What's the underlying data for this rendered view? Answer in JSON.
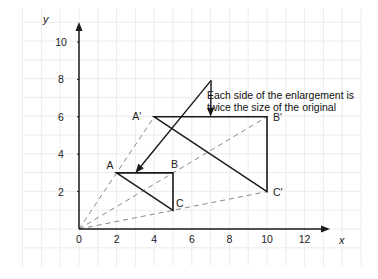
{
  "axes": {
    "x_label": "x",
    "y_label": "y",
    "x_ticks": [
      {
        "value": 0,
        "label": "0"
      },
      {
        "value": 2,
        "label": "2"
      },
      {
        "value": 4,
        "label": "4"
      },
      {
        "value": 6,
        "label": "6"
      },
      {
        "value": 8,
        "label": "8"
      },
      {
        "value": 10,
        "label": "10"
      },
      {
        "value": 12,
        "label": "12"
      }
    ],
    "y_ticks": [
      {
        "value": 2,
        "label": "2"
      },
      {
        "value": 4,
        "label": "4"
      },
      {
        "value": 6,
        "label": "6"
      },
      {
        "value": 8,
        "label": "8"
      },
      {
        "value": 10,
        "label": "10"
      }
    ],
    "x_range": [
      -3,
      14.5
    ],
    "y_range": [
      -1.9,
      11.7
    ],
    "grid": true
  },
  "centre_of_enlargement": {
    "x": 0,
    "y": 0
  },
  "scale_factor": 2,
  "original_triangle": {
    "vertices": [
      {
        "name": "A",
        "label": "A",
        "x": 2,
        "y": 3
      },
      {
        "name": "B",
        "label": "B",
        "x": 5,
        "y": 3
      },
      {
        "name": "C",
        "label": "C",
        "x": 5,
        "y": 1
      }
    ]
  },
  "enlarged_triangle": {
    "vertices": [
      {
        "name": "A-prime",
        "label": "A′",
        "x": 4,
        "y": 6
      },
      {
        "name": "B-prime",
        "label": "B′",
        "x": 10,
        "y": 6
      },
      {
        "name": "C-prime",
        "label": "C′",
        "x": 10,
        "y": 2
      }
    ]
  },
  "annotation": {
    "line1": "Each side of the enlargement is",
    "line2": "twice the size of the original",
    "pointer_origin": {
      "x": 7,
      "y": 8
    },
    "pointer_targets": [
      {
        "x": 3,
        "y": 3
      },
      {
        "x": 7,
        "y": 6
      }
    ]
  },
  "colors": {
    "lines": "#1a1a1a",
    "rays": "#888888",
    "grid": "#ececec"
  }
}
